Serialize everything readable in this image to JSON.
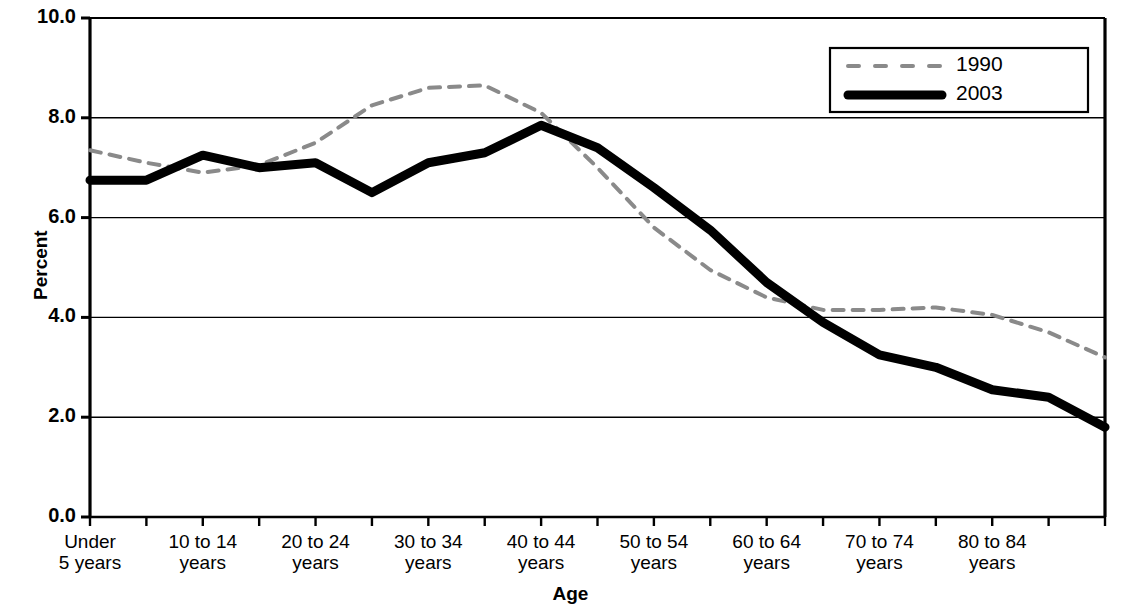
{
  "chart_data": {
    "type": "line",
    "title": "",
    "xlabel": "Age",
    "ylabel": "Percent",
    "ylim": [
      0.0,
      10.0
    ],
    "yticks": [
      "0.0",
      "2.0",
      "4.0",
      "6.0",
      "8.0",
      "10.0"
    ],
    "ytick_values": [
      0.0,
      2.0,
      4.0,
      6.0,
      8.0,
      10.0
    ],
    "grid": "horizontal",
    "legend_position": "top-right",
    "categories": [
      "Under 5 years",
      "5 to 9 years",
      "10 to 14 years",
      "15 to 19 years",
      "20 to 24 years",
      "25 to 29 years",
      "30 to 34 years",
      "35 to 39 years",
      "40 to 44 years",
      "45 to 49 years",
      "50 to 54 years",
      "55 to 59 years",
      "60 to 64 years",
      "65 to 69 years",
      "70 to 74 years",
      "75 to 79 years",
      "80 to 84 years",
      "85 to 89 years",
      "90 years and over"
    ],
    "visible_tick_labels": [
      {
        "index": 0,
        "line1": "Under",
        "line2": "5 years"
      },
      {
        "index": 2,
        "line1": "10 to 14",
        "line2": "years"
      },
      {
        "index": 4,
        "line1": "20 to 24",
        "line2": "years"
      },
      {
        "index": 6,
        "line1": "30 to 34",
        "line2": "years"
      },
      {
        "index": 8,
        "line1": "40 to 44",
        "line2": "years"
      },
      {
        "index": 10,
        "line1": "50 to 54",
        "line2": "years"
      },
      {
        "index": 12,
        "line1": "60 to 64",
        "line2": "years"
      },
      {
        "index": 14,
        "line1": "70 to 74",
        "line2": "years"
      },
      {
        "index": 16,
        "line1": "80 to 84",
        "line2": "years"
      }
    ],
    "series": [
      {
        "name": "1990",
        "style": "dashed",
        "color": "#8a8a8a",
        "width": 4,
        "values": [
          7.35,
          7.1,
          6.9,
          7.05,
          7.5,
          8.25,
          8.6,
          8.65,
          8.1,
          7.0,
          5.8,
          4.95,
          4.4,
          4.15,
          4.15,
          4.2,
          4.05,
          3.7,
          3.2
        ]
      },
      {
        "name": "2003",
        "style": "solid",
        "color": "#000000",
        "width": 9,
        "values": [
          6.75,
          6.75,
          7.25,
          7.0,
          7.1,
          6.5,
          7.1,
          7.3,
          7.85,
          7.4,
          6.6,
          5.75,
          4.7,
          3.9,
          3.25,
          3.0,
          2.55,
          2.4,
          1.8
        ]
      }
    ],
    "series_extra": {
      "1990_tail": [
        2.55,
        1.95,
        1.55,
        1.1
      ],
      "2003_tail": [
        1.75,
        1.5,
        1.5
      ]
    }
  },
  "legend": {
    "entries": [
      {
        "label": "1990",
        "style": "dashed",
        "color": "#8a8a8a"
      },
      {
        "label": "2003",
        "style": "solid",
        "color": "#000000"
      }
    ]
  },
  "axis": {
    "y_title": "Percent",
    "x_title": "Age"
  }
}
